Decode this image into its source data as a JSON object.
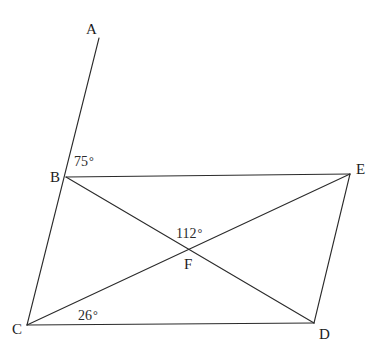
{
  "figure": {
    "type": "geometry-diagram",
    "background_color": "#ffffff",
    "stroke_color": "#2b2b2b",
    "stroke_width": 1.1,
    "width": 389,
    "height": 356
  },
  "points": {
    "A": {
      "label": "A",
      "x": 99,
      "y": 38,
      "label_x": 86,
      "label_y": 22
    },
    "B": {
      "label": "B",
      "x": 66,
      "y": 177,
      "label_x": 50,
      "label_y": 170
    },
    "C": {
      "label": "C",
      "x": 27,
      "y": 325,
      "label_x": 12,
      "label_y": 322
    },
    "D": {
      "label": "D",
      "x": 314,
      "y": 323,
      "label_x": 319,
      "label_y": 327
    },
    "E": {
      "label": "E",
      "x": 350,
      "y": 174,
      "label_x": 356,
      "label_y": 162
    },
    "F": {
      "label": "F",
      "x": 190,
      "y": 250,
      "label_x": 184,
      "label_y": 257
    }
  },
  "segments": [
    {
      "name": "segment-A-C",
      "from": "A",
      "to": "C",
      "note": "ray through B"
    },
    {
      "name": "segment-B-E",
      "from": "B",
      "to": "E"
    },
    {
      "name": "segment-C-D",
      "from": "C",
      "to": "D"
    },
    {
      "name": "segment-E-D",
      "from": "E",
      "to": "D"
    },
    {
      "name": "diagonal-B-D",
      "from": "B",
      "to": "D"
    },
    {
      "name": "diagonal-C-E",
      "from": "C",
      "to": "E"
    }
  ],
  "angles": [
    {
      "name": "angle-at-B",
      "value": "75",
      "degree": "°",
      "x": 74,
      "y": 155,
      "vertex": "B"
    },
    {
      "name": "angle-at-F",
      "value": "112",
      "degree": "°",
      "x": 176,
      "y": 227,
      "vertex": "F"
    },
    {
      "name": "angle-at-C",
      "value": "26",
      "degree": "°",
      "x": 78,
      "y": 309,
      "vertex": "C"
    }
  ]
}
